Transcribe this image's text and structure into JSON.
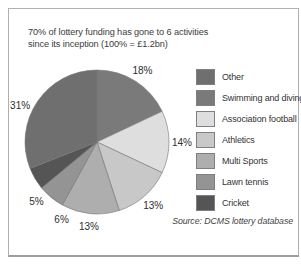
{
  "figure": {
    "title_lines": [
      "70% of lottery funding has gone to 6 activities",
      "since its inception (100% = £1.2bn)"
    ],
    "source_note": "Source: DCMS lottery database"
  },
  "chart_data": {
    "type": "pie",
    "title": "70% of lottery funding has gone to 6 activities since its inception (100% = £1.2bn)",
    "note": "100% = £1.2bn",
    "value_suffix": "%",
    "direction": "clockwise",
    "start_angle_deg_from_north": 0,
    "legend_position": "right",
    "slices": [
      {
        "label": "Swimming and diving",
        "value": 18,
        "color": "#7a7a7a"
      },
      {
        "label": "Association football",
        "value": 14,
        "color": "#dedede"
      },
      {
        "label": "Athletics",
        "value": 13,
        "color": "#c8c8c8"
      },
      {
        "label": "Multi Sports",
        "value": 13,
        "color": "#aeaeae"
      },
      {
        "label": "Lawn tennis",
        "value": 6,
        "color": "#949494"
      },
      {
        "label": "Cricket",
        "value": 5,
        "color": "#555555"
      },
      {
        "label": "Other",
        "value": 31,
        "color": "#6f6f6f"
      }
    ],
    "legend_order": [
      "Other",
      "Swimming and diving",
      "Association football",
      "Athletics",
      "Multi Sports",
      "Lawn tennis",
      "Cricket"
    ]
  }
}
